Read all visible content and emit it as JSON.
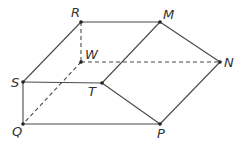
{
  "diagram": {
    "type": "solid-figure",
    "colors": {
      "line": "#4a4a4a",
      "dot": "#222222",
      "label": "#333333",
      "background": "#ffffff"
    },
    "vertices": [
      {
        "name": "R",
        "x": 81,
        "y": 22,
        "label_x": 71,
        "label_y": 17
      },
      {
        "name": "M",
        "x": 160,
        "y": 22,
        "label_x": 163,
        "label_y": 19
      },
      {
        "name": "W",
        "x": 81,
        "y": 62,
        "label_x": 85,
        "label_y": 59
      },
      {
        "name": "N",
        "x": 220,
        "y": 62,
        "label_x": 224,
        "label_y": 67
      },
      {
        "name": "S",
        "x": 23,
        "y": 82,
        "label_x": 11,
        "label_y": 87
      },
      {
        "name": "T",
        "x": 102,
        "y": 83,
        "label_x": 88,
        "label_y": 96
      },
      {
        "name": "Q",
        "x": 23,
        "y": 124,
        "label_x": 12,
        "label_y": 136
      },
      {
        "name": "P",
        "x": 160,
        "y": 124,
        "label_x": 157,
        "label_y": 138
      }
    ],
    "solid_edges": [
      [
        "R",
        "M"
      ],
      [
        "M",
        "N"
      ],
      [
        "R",
        "S"
      ],
      [
        "M",
        "T"
      ],
      [
        "S",
        "T"
      ],
      [
        "T",
        "P"
      ],
      [
        "N",
        "P"
      ],
      [
        "S",
        "Q"
      ],
      [
        "Q",
        "P"
      ]
    ],
    "dashed_edges": [
      [
        "R",
        "W"
      ],
      [
        "W",
        "N"
      ],
      [
        "W",
        "Q"
      ]
    ]
  }
}
